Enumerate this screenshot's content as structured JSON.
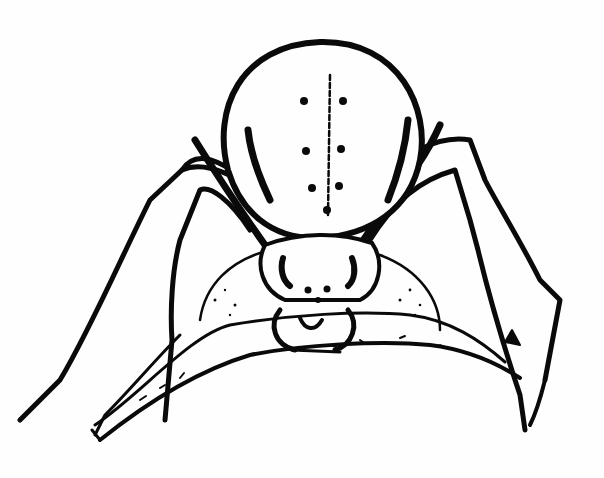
{
  "image": {
    "subject": "Ink illustration of a spider perched on a twig, front view",
    "style": "black and white pen-and-ink drawing",
    "colors": {
      "ink": "#0a0a0a",
      "paper": "#fefefe"
    }
  },
  "parts": {
    "abdomen": {
      "label": "abdomen",
      "spots": 6
    },
    "cephalothorax": {
      "label": "cephalothorax",
      "eyes": 4
    },
    "chelicerae": {
      "label": "chelicerae"
    },
    "legs": {
      "label": "legs",
      "count": 8
    },
    "twig": {
      "label": "twig"
    }
  }
}
